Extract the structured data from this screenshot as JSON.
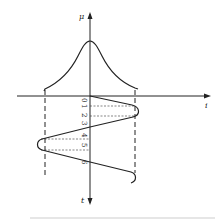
{
  "diagram": {
    "axes": {
      "vertical_top_label": "μ",
      "horizontal_label": "i",
      "vertical_bottom_label": "t"
    },
    "time_ticks": [
      "0",
      "1",
      "2",
      "3",
      "4",
      "5",
      "6"
    ],
    "curves": {
      "upper": "bell-shaped membership curve μ(i)",
      "lower": "oscillating current i(t) with projection lines"
    },
    "caption": "……"
  }
}
